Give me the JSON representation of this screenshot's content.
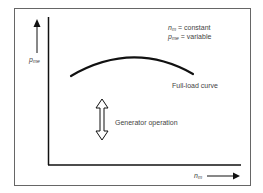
{
  "diagram": {
    "y_axis_label": {
      "main": "p",
      "sub": "me"
    },
    "x_axis_label": {
      "main": "n",
      "sub": "m"
    },
    "legend": [
      {
        "main": "n",
        "sub": "m",
        "text": " = constant"
      },
      {
        "main": "p",
        "sub": "me",
        "text": " = variable"
      }
    ],
    "curve_label": "Full-load curve",
    "operation_label": "Generator operation",
    "colors": {
      "line": "#111111",
      "frame": "#666666",
      "text": "#444444"
    }
  }
}
